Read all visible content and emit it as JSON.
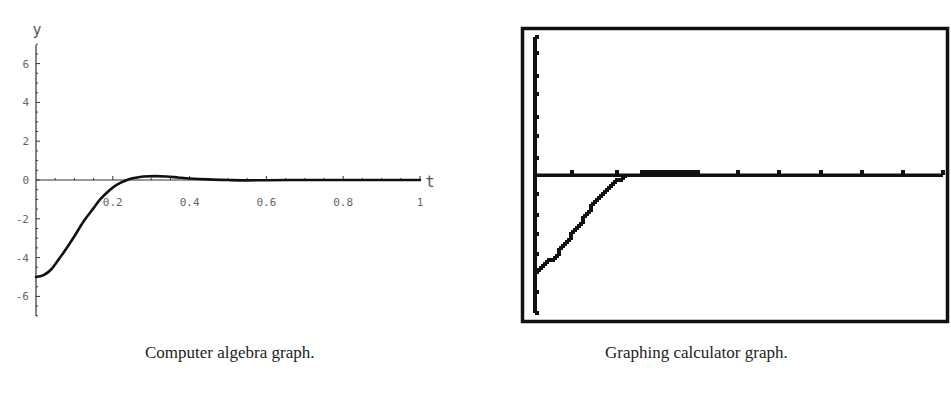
{
  "figure": {
    "left_caption": "Computer algebra graph.",
    "right_caption": "Graphing calculator graph."
  },
  "chart_data": [
    {
      "type": "line",
      "title": "",
      "caption": "Computer algebra graph.",
      "xlabel": "t",
      "ylabel": "y",
      "xlim": [
        0,
        1
      ],
      "ylim": [
        -7,
        7
      ],
      "x_ticks": [
        0.2,
        0.4,
        0.6,
        0.8,
        1
      ],
      "x_tick_labels": [
        "0.2",
        "0.4",
        "0.6",
        "0.8",
        "1"
      ],
      "y_ticks": [
        -6,
        -4,
        -2,
        0,
        2,
        4,
        6
      ],
      "y_tick_labels": [
        "-6",
        "-4",
        "-2",
        "0",
        "2",
        "4",
        "6"
      ],
      "grid": false,
      "series": [
        {
          "name": "y(t)",
          "x": [
            0,
            0.02,
            0.04,
            0.0625,
            0.08,
            0.1,
            0.125,
            0.15,
            0.167,
            0.19,
            0.21,
            0.237,
            0.26,
            0.28,
            0.31,
            0.34,
            0.37,
            0.4,
            0.45,
            0.5,
            0.55,
            0.6,
            0.7,
            0.8,
            0.9,
            1.0
          ],
          "y": [
            -5,
            -4.9,
            -4.6,
            -4.0,
            -3.5,
            -2.9,
            -2.1,
            -1.45,
            -1.0,
            -0.55,
            -0.25,
            0,
            0.12,
            0.18,
            0.2,
            0.18,
            0.13,
            0.08,
            0.03,
            0.0,
            -0.02,
            -0.01,
            0,
            0,
            0,
            0
          ]
        }
      ]
    },
    {
      "type": "line",
      "title": "",
      "caption": "Graphing calculator graph.",
      "xlabel": "",
      "ylabel": "",
      "xlim": [
        0,
        1
      ],
      "ylim": [
        -7,
        7
      ],
      "x_ticks_count": 10,
      "y_ticks_count": 14,
      "x_tick_labels": [],
      "y_tick_labels": [],
      "grid": false,
      "style": "pixelated calculator screen with frame",
      "series": [
        {
          "name": "y(t)",
          "x": [
            0,
            0.025,
            0.05,
            0.075,
            0.1,
            0.125,
            0.15,
            0.175,
            0.2,
            0.22,
            0.24,
            0.3,
            0.4,
            0.5,
            1.0
          ],
          "y": [
            -5,
            -4.5,
            -4.0,
            -3.3,
            -2.7,
            -1.9,
            -1.2,
            -0.65,
            -0.25,
            -0.1,
            0,
            0.15,
            0.1,
            0,
            0
          ]
        }
      ]
    }
  ]
}
